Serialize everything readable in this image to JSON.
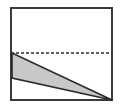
{
  "figure": {
    "type": "geometry-diagram",
    "canvas": {
      "width": 122,
      "height": 110,
      "background": "#ffffff"
    },
    "colors": {
      "outline": "#3a3a3a",
      "shape_fill": "#c8c8c8",
      "shape_stroke": "#2b2b2b",
      "dashed_line": "#2b2b2b",
      "background": "#ffffff"
    },
    "rectangle": {
      "label": "outer-rectangle",
      "x": 11,
      "y": 8,
      "width": 101,
      "height": 92,
      "stroke_width": 2,
      "fill": "none"
    },
    "dashed_line": {
      "label": "horizontal-dashed-line",
      "x1": 11,
      "y1": 53,
      "x2": 112,
      "y2": 53,
      "stroke_width": 1.6,
      "dash_pattern": "3 2"
    },
    "triangle": {
      "label": "shaded-wedge",
      "points": "12,53 12,78 112,100",
      "vertices": [
        {
          "name": "upper-left-vertex",
          "x": 12,
          "y": 53
        },
        {
          "name": "lower-left-vertex",
          "x": 12,
          "y": 78
        },
        {
          "name": "right-apex",
          "x": 112,
          "y": 100
        }
      ],
      "stroke_width": 1.6
    }
  }
}
